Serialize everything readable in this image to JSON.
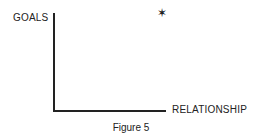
{
  "chart_data": {
    "type": "scatter",
    "title": "",
    "caption": "Figure 5",
    "xlabel": "RELATIONSHIP",
    "ylabel": "GOALS",
    "xlim": [
      0,
      1
    ],
    "ylim": [
      0,
      1
    ],
    "grid": false,
    "legend": null,
    "series": [
      {
        "name": "position",
        "marker": "star",
        "points": [
          {
            "x": 0.97,
            "y": 0.98
          }
        ]
      }
    ]
  },
  "labels": {
    "ylabel": "GOALS",
    "xlabel": "RELATIONSHIP",
    "caption": "Figure 5",
    "marker_glyph": "✶"
  }
}
